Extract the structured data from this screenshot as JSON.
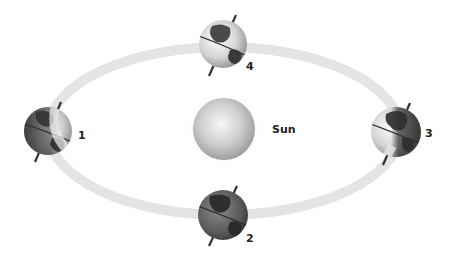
{
  "diagram": {
    "type": "earth-orbit-around-sun",
    "sun": {
      "label": "Sun",
      "cx": 224,
      "cy": 129,
      "r": 31
    },
    "orbit": {
      "cx": 224,
      "cy": 131,
      "rx": 176,
      "ry": 84,
      "band_width": 10,
      "color": "#e4e4e4"
    },
    "earths": [
      {
        "label": "1",
        "cx": 48,
        "cy": 131,
        "r": 24,
        "label_x": 80,
        "label_y": 130,
        "shade": "left"
      },
      {
        "label": "2",
        "cx": 223,
        "cy": 215,
        "r": 25,
        "label_x": 248,
        "label_y": 234,
        "shade": "none"
      },
      {
        "label": "3",
        "cx": 396,
        "cy": 132,
        "r": 25,
        "label_x": 427,
        "label_y": 129,
        "shade": "right"
      },
      {
        "label": "4",
        "cx": 223,
        "cy": 44,
        "r": 24,
        "label_x": 248,
        "label_y": 62,
        "shade": "light"
      }
    ],
    "colors": {
      "sun_light": "#f2f2f2",
      "sun_dark": "#9c9c9c",
      "globe_light": "#e8e8e8",
      "globe_dark": "#4a4a4a",
      "land": "#3a3a3a",
      "axis": "#333333",
      "label": "#222222"
    }
  }
}
